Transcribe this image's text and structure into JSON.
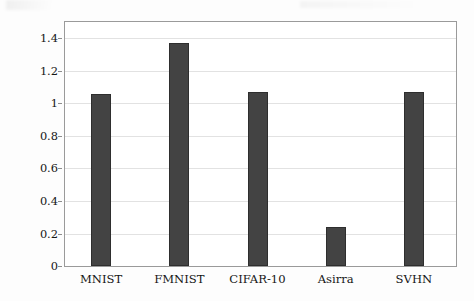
{
  "figure": {
    "background_color": "#fdfdfd",
    "frame_color": "#9a9a9a",
    "grid_color": "#e2e2e2",
    "bar_color": "#434343"
  },
  "chart_data": {
    "type": "bar",
    "title": "",
    "xlabel": "",
    "ylabel": "Log-ratio of average inference time",
    "categories": [
      "MNIST",
      "FMNIST",
      "CIFAR-10",
      "Asirra",
      "SVHN"
    ],
    "values": [
      1.06,
      1.37,
      1.07,
      0.24,
      1.07
    ],
    "ylim": [
      0,
      1.5
    ],
    "yticks": [
      0,
      0.2,
      0.4,
      0.6,
      0.8,
      1,
      1.2,
      1.4
    ],
    "ytick_labels": [
      "0",
      "0.2",
      "0.4",
      "0.6",
      "0.8",
      "1",
      "1.2",
      "1.4"
    ],
    "grid": "horizontal",
    "legend": "none",
    "series": [
      {
        "name": "Log-ratio of average inference time",
        "values": [
          1.06,
          1.37,
          1.07,
          0.24,
          1.07
        ],
        "color": "#434343"
      }
    ]
  }
}
